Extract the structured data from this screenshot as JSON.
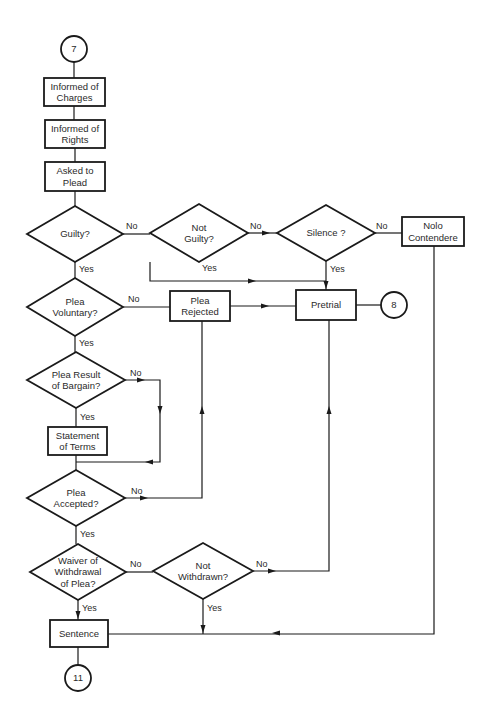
{
  "diagram": {
    "type": "flowchart",
    "colors": {
      "stroke": "#1a1a1a",
      "text": "#2a2a2a",
      "background": "#ffffff"
    },
    "connectors": [
      {
        "id": "start",
        "label": "7",
        "cx": 74,
        "cy": 49,
        "r": 13
      },
      {
        "id": "pretrial-out",
        "label": "8",
        "cx": 394,
        "cy": 305,
        "r": 13
      },
      {
        "id": "end",
        "label": "11",
        "cx": 78,
        "cy": 678,
        "r": 13
      }
    ],
    "processes": [
      {
        "id": "informed-charges",
        "lines": [
          "Informed of",
          "Charges"
        ],
        "x": 44,
        "y": 78,
        "w": 61,
        "h": 28
      },
      {
        "id": "informed-rights",
        "lines": [
          "Informed of",
          "Rights"
        ],
        "x": 45,
        "y": 120,
        "w": 60,
        "h": 28
      },
      {
        "id": "asked-to-plead",
        "lines": [
          "Asked to",
          "Plead"
        ],
        "x": 45,
        "y": 162,
        "w": 60,
        "h": 29
      },
      {
        "id": "plea-rejected",
        "lines": [
          "Plea",
          "Rejected"
        ],
        "x": 170,
        "y": 291,
        "w": 60,
        "h": 30
      },
      {
        "id": "pretrial",
        "lines": [
          "Pretrial"
        ],
        "x": 296,
        "y": 290,
        "w": 60,
        "h": 30
      },
      {
        "id": "nolo-contendere",
        "lines": [
          "Nolo",
          "Contendere"
        ],
        "x": 402,
        "y": 217,
        "w": 62,
        "h": 29
      },
      {
        "id": "statement-of-terms",
        "lines": [
          "Statement",
          "of Terms"
        ],
        "x": 48,
        "y": 427,
        "w": 59,
        "h": 28
      },
      {
        "id": "sentence",
        "lines": [
          "Sentence"
        ],
        "x": 50,
        "y": 620,
        "w": 58,
        "h": 27
      }
    ],
    "decisions": [
      {
        "id": "guilty",
        "lines": [
          "Guilty?"
        ],
        "cx": 75,
        "cy": 234,
        "hw": 48,
        "hh": 28
      },
      {
        "id": "not-guilty",
        "lines": [
          "Not",
          "Guilty?"
        ],
        "cx": 199,
        "cy": 233,
        "hw": 49,
        "hh": 29
      },
      {
        "id": "silence",
        "lines": [
          "Silence ?"
        ],
        "cx": 326,
        "cy": 233,
        "hw": 49,
        "hh": 28
      },
      {
        "id": "plea-voluntary",
        "lines": [
          "Plea",
          "Voluntary?"
        ],
        "cx": 75,
        "cy": 307,
        "hw": 48,
        "hh": 29
      },
      {
        "id": "plea-result-of-bargain",
        "lines": [
          "Plea Result",
          "of Bargain?"
        ],
        "cx": 76,
        "cy": 380,
        "hw": 49,
        "hh": 28
      },
      {
        "id": "plea-accepted",
        "lines": [
          "Plea",
          "Accepted?"
        ],
        "cx": 76,
        "cy": 498,
        "hw": 49,
        "hh": 28
      },
      {
        "id": "waiver-of-withdrawal",
        "lines": [
          "Waiver of",
          "Withdrawal",
          "of Plea?"
        ],
        "cx": 78,
        "cy": 572,
        "hw": 48,
        "hh": 28
      },
      {
        "id": "not-withdrawn",
        "lines": [
          "Not",
          "Withdrawn?"
        ],
        "cx": 203,
        "cy": 571,
        "hw": 50,
        "hh": 28
      }
    ],
    "edge_labels": [
      {
        "text": "No",
        "x": 126,
        "y": 229
      },
      {
        "text": "Yes",
        "x": 79,
        "y": 272
      },
      {
        "text": "No",
        "x": 250,
        "y": 229
      },
      {
        "text": "Yes",
        "x": 202,
        "y": 271
      },
      {
        "text": "No",
        "x": 376,
        "y": 229
      },
      {
        "text": "Yes",
        "x": 330,
        "y": 272
      },
      {
        "text": "No",
        "x": 128,
        "y": 302
      },
      {
        "text": "Yes",
        "x": 79,
        "y": 346
      },
      {
        "text": "No",
        "x": 130,
        "y": 376
      },
      {
        "text": "Yes",
        "x": 80,
        "y": 420
      },
      {
        "text": "No",
        "x": 131,
        "y": 494
      },
      {
        "text": "Yes",
        "x": 80,
        "y": 537
      },
      {
        "text": "No",
        "x": 130,
        "y": 567
      },
      {
        "text": "No",
        "x": 256,
        "y": 567
      },
      {
        "text": "Yes",
        "x": 82,
        "y": 611
      },
      {
        "text": "Yes",
        "x": 207,
        "y": 611
      }
    ],
    "lines": [
      "M74 62 V78",
      "M74 106 V120",
      "M75 148 V162",
      "M75 191 V206",
      "M123 234 H150",
      "M248 233 H277",
      "M375 233 H402",
      "M75 262 V278",
      "M150 262 V281 H326",
      "M326 261 V290",
      "M123 307 H170",
      "M230 306 H296",
      "M356 305 H381",
      "M75 336 V352",
      "M125 380 H160 V462 H76",
      "M76 408 V427",
      "M76 455 V470",
      "M125 498 H202 V321",
      "M76 526 V544",
      "M126 572 H153",
      "M253 571 H329 V320",
      "M78 600 V620",
      "M203 599 V634",
      "M108 634 H434 V246",
      "M78 647 V665"
    ],
    "arrows": [
      {
        "x": 270,
        "y": 233,
        "dir": "right"
      },
      {
        "x": 256,
        "y": 281,
        "dir": "right"
      },
      {
        "x": 326,
        "y": 289,
        "dir": "down"
      },
      {
        "x": 269,
        "y": 306,
        "dir": "right"
      },
      {
        "x": 145,
        "y": 380,
        "dir": "right"
      },
      {
        "x": 160,
        "y": 414,
        "dir": "down"
      },
      {
        "x": 145,
        "y": 462,
        "dir": "left"
      },
      {
        "x": 202,
        "y": 406,
        "dir": "up"
      },
      {
        "x": 148,
        "y": 498,
        "dir": "right"
      },
      {
        "x": 276,
        "y": 571,
        "dir": "right"
      },
      {
        "x": 78,
        "y": 619,
        "dir": "down"
      },
      {
        "x": 203,
        "y": 633,
        "dir": "down"
      },
      {
        "x": 272,
        "y": 633,
        "dir": "left"
      },
      {
        "x": 329,
        "y": 406,
        "dir": "up"
      }
    ]
  }
}
